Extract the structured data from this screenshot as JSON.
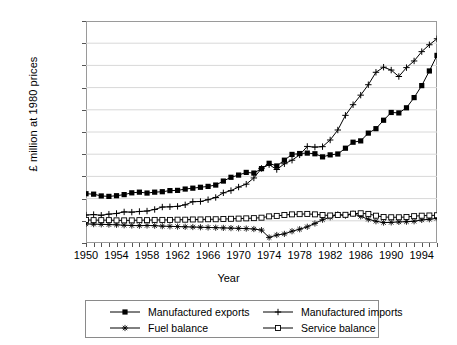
{
  "chart_data": {
    "type": "line",
    "title": "",
    "xlabel": "Year",
    "ylabel": "£ million at 1980 prices",
    "xlim": [
      1950,
      1996
    ],
    "ylim": [
      -10000,
      90000
    ],
    "grid": true,
    "legend_position": "bottom",
    "ytick_labels": [
      "90,000",
      "80,000",
      "70,000",
      "60,000",
      "50,000",
      "40,000",
      "30,000",
      "20,000",
      "10,000",
      "0",
      "–10,000"
    ],
    "ytick_values": [
      90000,
      80000,
      70000,
      60000,
      50000,
      40000,
      30000,
      20000,
      10000,
      0,
      -10000
    ],
    "xtick_labels": [
      "1950",
      "1954",
      "1958",
      "1962",
      "1966",
      "1970",
      "1974",
      "1978",
      "1982",
      "1986",
      "1990",
      "1994"
    ],
    "xtick_values": [
      1950,
      1954,
      1958,
      1962,
      1966,
      1970,
      1974,
      1978,
      1982,
      1986,
      1990,
      1994
    ],
    "x": [
      1950,
      1951,
      1952,
      1953,
      1954,
      1955,
      1956,
      1957,
      1958,
      1959,
      1960,
      1961,
      1962,
      1963,
      1964,
      1965,
      1966,
      1967,
      1968,
      1969,
      1970,
      1971,
      1972,
      1973,
      1974,
      1975,
      1976,
      1977,
      1978,
      1979,
      1980,
      1981,
      1982,
      1983,
      1984,
      1985,
      1986,
      1987,
      1988,
      1989,
      1990,
      1991,
      1992,
      1993,
      1994,
      1995,
      1996
    ],
    "series": [
      {
        "name": "Manufactured exports",
        "marker": "filled-square",
        "color": "#000000",
        "values": [
          12200,
          12000,
          11200,
          11000,
          11300,
          11800,
          12600,
          12900,
          12500,
          12900,
          13100,
          13600,
          13700,
          14300,
          14700,
          15100,
          15500,
          16100,
          17900,
          19600,
          20600,
          21800,
          21500,
          23500,
          25900,
          24700,
          27300,
          29900,
          30300,
          30500,
          30200,
          28800,
          29700,
          30100,
          32700,
          35400,
          36000,
          39500,
          41500,
          45300,
          48800,
          48600,
          50900,
          55500,
          60900,
          67500,
          74500
        ]
      },
      {
        "name": "Manufactured imports",
        "marker": "plus",
        "color": "#000000",
        "values": [
          2600,
          2800,
          2500,
          3000,
          3300,
          4000,
          3900,
          4200,
          4400,
          5100,
          6200,
          6300,
          6500,
          7200,
          8600,
          8700,
          9500,
          10500,
          12600,
          13600,
          15200,
          16500,
          19300,
          23600,
          25300,
          23100,
          25700,
          27300,
          29700,
          33500,
          33200,
          33400,
          36400,
          40900,
          47500,
          52300,
          56600,
          61300,
          66900,
          69200,
          67900,
          65000,
          69000,
          72000,
          76200,
          79300,
          82000
        ]
      },
      {
        "name": "Fuel balance",
        "marker": "asterisk",
        "color": "#000000",
        "values": [
          -1400,
          -1500,
          -1600,
          -1700,
          -1800,
          -2000,
          -2100,
          -2200,
          -2100,
          -2200,
          -2400,
          -2500,
          -2600,
          -2700,
          -2800,
          -2900,
          -3000,
          -3100,
          -3200,
          -3300,
          -3400,
          -3500,
          -3700,
          -4200,
          -7500,
          -6400,
          -5900,
          -4700,
          -3800,
          -2700,
          -1200,
          500,
          1600,
          2900,
          2300,
          3200,
          2000,
          700,
          -200,
          -800,
          -700,
          -500,
          -400,
          -200,
          400,
          700,
          1100
        ]
      },
      {
        "name": "Service balance",
        "marker": "open-square",
        "color": "#000000",
        "values": [
          400,
          300,
          300,
          300,
          200,
          200,
          200,
          300,
          300,
          400,
          400,
          400,
          500,
          500,
          600,
          600,
          700,
          700,
          800,
          900,
          1000,
          1100,
          1200,
          1400,
          2000,
          2200,
          2600,
          2900,
          3000,
          3100,
          2900,
          2600,
          2400,
          2600,
          2700,
          3200,
          3400,
          3100,
          2300,
          1700,
          1600,
          1600,
          1700,
          2100,
          2300,
          2400,
          2500
        ]
      }
    ]
  },
  "legend": {
    "items": [
      {
        "label": "Manufactured exports",
        "marker": "filled-square"
      },
      {
        "label": "Manufactured imports",
        "marker": "plus"
      },
      {
        "label": "Fuel balance",
        "marker": "asterisk"
      },
      {
        "label": "Service balance",
        "marker": "open-square"
      }
    ]
  }
}
